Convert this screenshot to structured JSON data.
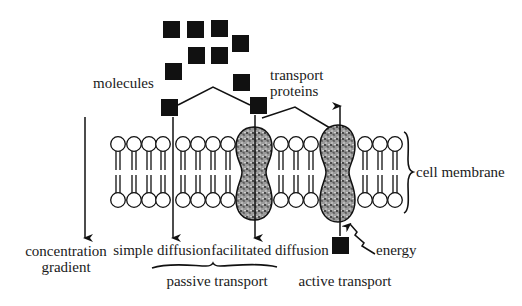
{
  "colors": {
    "ink": "#111111",
    "background": "#ffffff",
    "protein": "#8a8a8a"
  },
  "labels": {
    "molecules": "molecules",
    "transport_proteins_line1": "transport",
    "transport_proteins_line2": "proteins",
    "cell_membrane": "cell membrane",
    "concentration_line1": "concentration",
    "concentration_line2": "gradient",
    "simple_diffusion": "simple diffusion",
    "facilitated_diffusion": "facilitated diffusion",
    "energy": "energy",
    "passive_transport": "passive transport",
    "active_transport": "active transport"
  }
}
